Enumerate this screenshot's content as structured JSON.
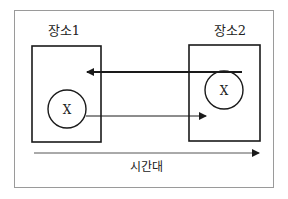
{
  "diagram": {
    "places": [
      {
        "label": "장소1",
        "entity": "X",
        "has_entity": true
      },
      {
        "label": "장소2",
        "entity": "X",
        "has_entity": true
      }
    ],
    "timeline_label": "시간대",
    "arrows": [
      {
        "from": "장소2",
        "to": "장소1",
        "style": "thick"
      },
      {
        "from": "장소1.X",
        "to": "장소2",
        "style": "thin"
      }
    ],
    "colors": {
      "frame": "#9a9a9a",
      "stroke": "#1a1a1a",
      "background": "#ffffff"
    }
  }
}
